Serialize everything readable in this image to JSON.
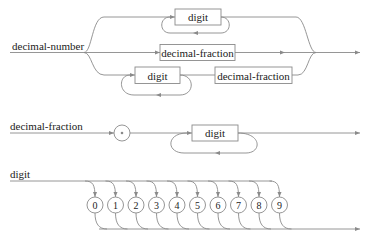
{
  "diagrams": [
    {
      "rule_name": "decimal-number",
      "branches": [
        {
          "elements": [
            {
              "type": "nonterminal",
              "label": "digit",
              "repeat": true
            }
          ]
        },
        {
          "elements": [
            {
              "type": "nonterminal",
              "label": "decimal-fraction"
            }
          ]
        },
        {
          "elements": [
            {
              "type": "nonterminal",
              "label": "digit",
              "repeat": true
            },
            {
              "type": "nonterminal",
              "label": "decimal-fraction"
            }
          ]
        }
      ]
    },
    {
      "rule_name": "decimal-fraction",
      "elements": [
        {
          "type": "terminal",
          "label": "•"
        },
        {
          "type": "nonterminal",
          "label": "digit",
          "repeat": true
        }
      ]
    },
    {
      "rule_name": "digit",
      "terminals": [
        "0",
        "1",
        "2",
        "3",
        "4",
        "5",
        "6",
        "7",
        "8",
        "9"
      ]
    }
  ],
  "colors": {
    "line": "#8a8a8a",
    "text": "#222222",
    "background": "#ffffff"
  }
}
